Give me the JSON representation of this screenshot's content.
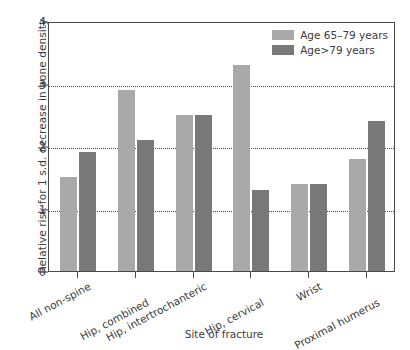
{
  "chart_data": {
    "type": "bar",
    "title": "",
    "xlabel": "Site of fracture",
    "ylabel": "Relative risk for 1 s.d. decrease in bone density",
    "ylim": [
      0,
      4
    ],
    "yticks": [
      0,
      1,
      2,
      3,
      4
    ],
    "ytick_labels": [
      "0",
      "1",
      "2",
      "3",
      "4"
    ],
    "grid": "horizontal dotted at 1, 2, 3",
    "legend_position": "top-right inside",
    "categories": [
      "All non-spine",
      "Hip, combined",
      "Hip, intertrochanteric",
      "Hip, cervical",
      "Wrist",
      "Proximal humerus"
    ],
    "series": [
      {
        "name": "Age 65–79 years",
        "color": "#a9a9a9",
        "values": [
          1.5,
          2.9,
          2.5,
          3.3,
          1.4,
          1.8
        ]
      },
      {
        "name": "Age>79 years",
        "color": "#787878",
        "values": [
          1.9,
          2.1,
          2.5,
          1.3,
          1.4,
          2.4
        ]
      }
    ]
  },
  "legend": {
    "items": [
      {
        "label": "Age 65–79 years",
        "swatch": "light"
      },
      {
        "label": "Age>79 years",
        "swatch": "dark"
      }
    ]
  }
}
